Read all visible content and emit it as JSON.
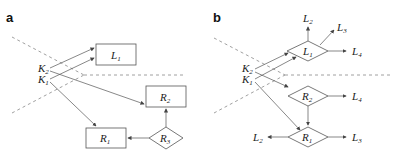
{
  "panels": [
    {
      "id": "a",
      "label": "a"
    },
    {
      "id": "b",
      "label": "b"
    }
  ],
  "a": {
    "nodes": {
      "K2": {
        "base": "K",
        "sub": "2"
      },
      "K1": {
        "base": "K",
        "sub": "1"
      },
      "L1": {
        "base": "L",
        "sub": "1",
        "shape": "rectangle"
      },
      "R2": {
        "base": "R",
        "sub": "2",
        "shape": "rectangle"
      },
      "R1": {
        "base": "R",
        "sub": "1",
        "shape": "rectangle"
      },
      "R3": {
        "base": "R",
        "sub": "3",
        "shape": "diamond"
      }
    }
  },
  "b": {
    "nodes": {
      "K2": {
        "base": "K",
        "sub": "2"
      },
      "K1": {
        "base": "K",
        "sub": "1"
      },
      "L1": {
        "base": "L",
        "sub": "1",
        "shape": "diamond"
      },
      "R2": {
        "base": "R",
        "sub": "2",
        "shape": "diamond"
      },
      "R1": {
        "base": "R",
        "sub": "1",
        "shape": "diamond"
      },
      "L2top": {
        "base": "L",
        "sub": "2"
      },
      "L3top": {
        "base": "L",
        "sub": "3"
      },
      "L4top": {
        "base": "L",
        "sub": "4"
      },
      "L4mid": {
        "base": "L",
        "sub": "4"
      },
      "L2bot": {
        "base": "L",
        "sub": "2"
      },
      "L3bot": {
        "base": "L",
        "sub": "3"
      }
    }
  },
  "colors": {
    "line": "#555555",
    "dash": "#888888",
    "text": "#222222"
  }
}
